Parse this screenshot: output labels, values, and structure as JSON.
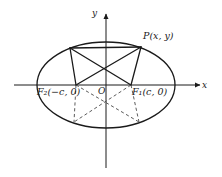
{
  "figure": {
    "background_color": "#ffffff",
    "stroke_color": "#1a1a1a",
    "dash_color": "#4a4a4a",
    "width": 222,
    "height": 177
  },
  "axes": {
    "x_label": "x",
    "y_label": "y",
    "origin_label": "O",
    "x_axis_y": 85,
    "x_axis_start": 14,
    "x_axis_end": 200,
    "y_axis_x": 106,
    "y_axis_top": 14,
    "y_axis_bottom": 168
  },
  "ellipse": {
    "center_x": 106,
    "center_y": 85,
    "semi_major_a": 69,
    "semi_minor_b": 43
  },
  "points": {
    "P": {
      "label": "P(x, y)",
      "x": 141,
      "y": 47
    },
    "P_left": {
      "label": "",
      "x": 70,
      "y": 48
    },
    "F1": {
      "label": "F₁(c, 0)",
      "x": 131,
      "y": 85
    },
    "F2": {
      "label": "F₂(−c, 0)",
      "x": 76,
      "y": 85
    },
    "Q_left": {
      "label": "",
      "x": 74,
      "y": 122
    },
    "Q_right": {
      "label": "",
      "x": 139,
      "y": 122
    }
  },
  "segments": {
    "solid": [
      {
        "name": "P-to-F2",
        "x1": 141,
        "y1": 47,
        "x2": 76,
        "y2": 85
      },
      {
        "name": "P-to-F1",
        "x1": 141,
        "y1": 47,
        "x2": 131,
        "y2": 85
      },
      {
        "name": "Pleft-to-F1",
        "x1": 70,
        "y1": 48,
        "x2": 131,
        "y2": 85
      },
      {
        "name": "Pleft-to-F2",
        "x1": 70,
        "y1": 48,
        "x2": 76,
        "y2": 85
      },
      {
        "name": "Pleft-to-P",
        "x1": 70,
        "y1": 48,
        "x2": 141,
        "y2": 47
      }
    ],
    "dashed": [
      {
        "name": "F2-to-Qright",
        "x1": 76,
        "y1": 85,
        "x2": 139,
        "y2": 122
      },
      {
        "name": "F1-to-Qleft",
        "x1": 131,
        "y1": 85,
        "x2": 74,
        "y2": 122
      },
      {
        "name": "F2-to-Qleft",
        "x1": 76,
        "y1": 85,
        "x2": 74,
        "y2": 122
      },
      {
        "name": "F1-to-Qright",
        "x1": 131,
        "y1": 85,
        "x2": 139,
        "y2": 122
      }
    ]
  },
  "chart_data": {
    "type": "scatter",
    "xlabel": "x",
    "ylabel": "y",
    "annotations": [
      "P(x, y)",
      "F₁(c, 0)",
      "F₂(−c, 0)",
      "O",
      "x",
      "y"
    ],
    "curves": [
      {
        "name": "ellipse",
        "kind": "ellipse",
        "center": [
          0,
          0
        ],
        "a": 69,
        "b": 43,
        "style": "solid"
      }
    ],
    "points": [
      {
        "name": "O",
        "x": 0,
        "y": 0
      },
      {
        "name": "F1",
        "x": 25,
        "y": 0
      },
      {
        "name": "F2",
        "x": -30,
        "y": 0
      },
      {
        "name": "P",
        "x": 35,
        "y": 38
      },
      {
        "name": "P'",
        "x": -36,
        "y": 37
      },
      {
        "name": "Q'",
        "x": -32,
        "y": -37
      },
      {
        "name": "Q",
        "x": 33,
        "y": -37
      }
    ],
    "grid": false,
    "legend": "none"
  }
}
